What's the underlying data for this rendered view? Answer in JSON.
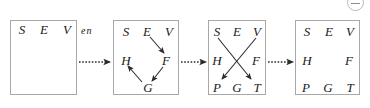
{
  "diagram": {
    "word_prefix": "S E V",
    "word_suffix": "en",
    "colors": {
      "box_border": "#a8a8a8",
      "text": "#1a1a1a",
      "arrow": "#2b2b2b",
      "icon_border": "#b9b9b9",
      "background": "#ffffff"
    },
    "icon": {
      "name": "collapse-minus-icon",
      "glyph": "−"
    },
    "stages": [
      {
        "id": "stage-1",
        "letters": [
          {
            "label": "S",
            "x": 22,
            "y": 29
          },
          {
            "label": "E",
            "x": 44,
            "y": 29
          },
          {
            "label": "V",
            "x": 67,
            "y": 29
          }
        ],
        "arrows": []
      },
      {
        "id": "stage-2",
        "letters": [
          {
            "label": "S",
            "x": 126,
            "y": 31
          },
          {
            "label": "E",
            "x": 147,
            "y": 31
          },
          {
            "label": "V",
            "x": 169,
            "y": 31
          },
          {
            "label": "H",
            "x": 126,
            "y": 60
          },
          {
            "label": "F",
            "x": 166,
            "y": 60
          },
          {
            "label": "G",
            "x": 148,
            "y": 87
          }
        ],
        "arrows": [
          {
            "from": "E",
            "to": "F",
            "x1": 150,
            "y1": 37,
            "x2": 164,
            "y2": 53
          },
          {
            "from": "F",
            "to": "G",
            "x1": 163,
            "y1": 67,
            "x2": 152,
            "y2": 81
          },
          {
            "from": "G",
            "to": "H",
            "x1": 142,
            "y1": 82,
            "x2": 128,
            "y2": 66
          }
        ]
      },
      {
        "id": "stage-3",
        "letters": [
          {
            "label": "S",
            "x": 217,
            "y": 31
          },
          {
            "label": "E",
            "x": 237,
            "y": 31
          },
          {
            "label": "V",
            "x": 257,
            "y": 31
          },
          {
            "label": "H",
            "x": 217,
            "y": 60
          },
          {
            "label": "F",
            "x": 256,
            "y": 60
          },
          {
            "label": "P",
            "x": 217,
            "y": 87
          },
          {
            "label": "G",
            "x": 237,
            "y": 87
          },
          {
            "label": "T",
            "x": 257,
            "y": 87
          }
        ],
        "arrows": [
          {
            "from": "S",
            "to": "T",
            "x1": 218,
            "y1": 38,
            "x2": 251,
            "y2": 79
          },
          {
            "from": "V",
            "to": "P",
            "x1": 256,
            "y1": 38,
            "x2": 222,
            "y2": 79
          }
        ]
      },
      {
        "id": "stage-4",
        "letters": [
          {
            "label": "S",
            "x": 307,
            "y": 31
          },
          {
            "label": "E",
            "x": 329,
            "y": 31
          },
          {
            "label": "V",
            "x": 350,
            "y": 31
          },
          {
            "label": "H",
            "x": 307,
            "y": 60
          },
          {
            "label": "F",
            "x": 349,
            "y": 60
          },
          {
            "label": "P",
            "x": 306,
            "y": 87
          },
          {
            "label": "G",
            "x": 328,
            "y": 87
          },
          {
            "label": "T",
            "x": 350,
            "y": 87
          }
        ],
        "arrows": []
      }
    ],
    "connectors": [
      {
        "id": "connector-1-2",
        "x1": 79,
        "x2": 110,
        "y": 62
      },
      {
        "id": "connector-2-3",
        "x1": 181,
        "x2": 206,
        "y": 62
      },
      {
        "id": "connector-3-4",
        "x1": 268,
        "x2": 293,
        "y": 62
      }
    ]
  }
}
